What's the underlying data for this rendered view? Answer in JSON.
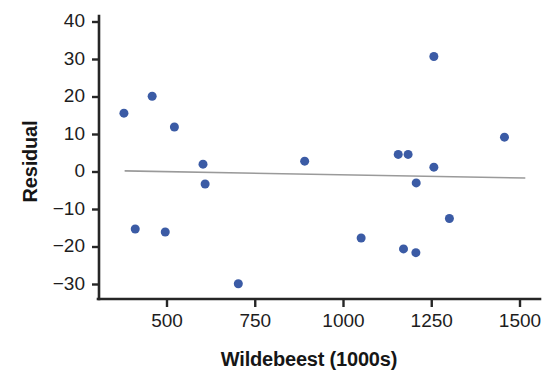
{
  "chart_data": {
    "type": "scatter",
    "title": "",
    "xlabel": "Wildebeest (1000s)",
    "ylabel": "Residual",
    "xlim": [
      320,
      1530
    ],
    "ylim": [
      -32,
      41
    ],
    "xticks": [
      500,
      750,
      1000,
      1250,
      1500
    ],
    "xtick_labels": [
      "500",
      "750",
      "1000",
      "1250",
      "1500"
    ],
    "yticks": [
      -30,
      -20,
      -10,
      0,
      10,
      20,
      30,
      40
    ],
    "ytick_labels": [
      "−30",
      "−20",
      "−10",
      "0",
      "10",
      "20",
      "30",
      "40"
    ],
    "grid": false,
    "legend": false,
    "marker_color": "#3b5ba5",
    "marker_size": 9,
    "axis_color": "#262626",
    "reference_line": {
      "name": "zero-residual-trend-line",
      "color": "#9a9a9a",
      "x": [
        380,
        1515
      ],
      "y": [
        0.3,
        -1.6
      ]
    },
    "points": [
      {
        "x": 378,
        "y": 15.7
      },
      {
        "x": 458,
        "y": 20.2
      },
      {
        "x": 521,
        "y": 12.0
      },
      {
        "x": 602,
        "y": 2.1
      },
      {
        "x": 608,
        "y": -3.2
      },
      {
        "x": 410,
        "y": -15.2
      },
      {
        "x": 495,
        "y": -16.0
      },
      {
        "x": 702,
        "y": -29.8
      },
      {
        "x": 890,
        "y": 2.9
      },
      {
        "x": 1050,
        "y": -17.6
      },
      {
        "x": 1155,
        "y": 4.7
      },
      {
        "x": 1183,
        "y": 4.7
      },
      {
        "x": 1206,
        "y": -2.9
      },
      {
        "x": 1256,
        "y": 1.3
      },
      {
        "x": 1170,
        "y": -20.5
      },
      {
        "x": 1205,
        "y": -21.5
      },
      {
        "x": 1256,
        "y": 30.8
      },
      {
        "x": 1300,
        "y": -12.4
      },
      {
        "x": 1456,
        "y": 9.3
      }
    ]
  },
  "axes": {
    "x_title": "Wildebeest (1000s)",
    "y_title": "Residual"
  }
}
